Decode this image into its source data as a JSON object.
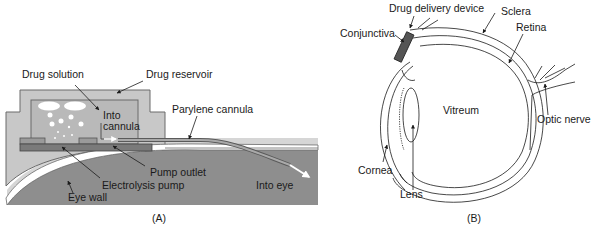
{
  "panel_a": {
    "caption": "(A)",
    "labels": {
      "drug_solution": "Drug solution",
      "drug_reservoir": "Drug reservoir",
      "into_cannula_1": "Into",
      "into_cannula_2": "cannula",
      "parylene_cannula": "Parylene cannula",
      "pump_outlet": "Pump outlet",
      "electrolysis_pump": "Electrolysis pump",
      "eye_wall": "Eye wall",
      "into_eye": "Into eye"
    },
    "colors": {
      "housing": "#c8c8c8",
      "reservoir": "#b9b9b9",
      "pump": "#7a7a7a",
      "eye": "#8e8e8e",
      "eye_wall": "#ffffff"
    }
  },
  "panel_b": {
    "caption": "(B)",
    "labels": {
      "drug_delivery_device": "Drug delivery device",
      "sclera": "Sclera",
      "conjunctiva": "Conjunctiva",
      "retina": "Retina",
      "vitreum": "Vitreum",
      "optic_nerve": "Optic nerve",
      "cornea": "Cornea",
      "lens": "Lens"
    }
  }
}
